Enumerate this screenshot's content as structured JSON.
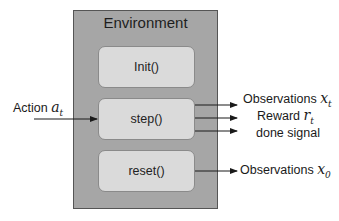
{
  "diagram": {
    "environment": {
      "title": "Environment",
      "functions": [
        {
          "id": "init",
          "label": "Init()"
        },
        {
          "id": "step",
          "label": "step()"
        },
        {
          "id": "reset",
          "label": "reset()"
        }
      ]
    },
    "inputs": {
      "action": {
        "label": "Action",
        "symbol": "a",
        "subscript": "t"
      }
    },
    "outputs": {
      "step": [
        {
          "label": "Observations",
          "symbol": "x",
          "subscript": "t"
        },
        {
          "label": "Reward",
          "symbol": "r",
          "subscript": "t"
        },
        {
          "label": "done signal",
          "symbol": "",
          "subscript": ""
        }
      ],
      "reset": [
        {
          "label": "Observations",
          "symbol": "x",
          "subscript": "0"
        }
      ]
    },
    "colors": {
      "environment_fill": "#a6a6a6",
      "function_fill": "#dadada",
      "arrow": "#1a1a1a"
    }
  }
}
